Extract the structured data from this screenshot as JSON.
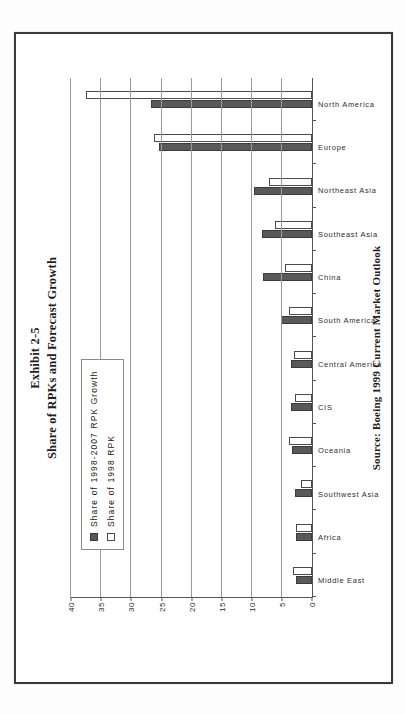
{
  "page": {
    "folio": "",
    "title_line1": "Exhibit 2-5",
    "title_line2": "Share of RPKs and Forecast Growth",
    "source": "Source: Boeing 1999 Current Market Outlook"
  },
  "legend": {
    "items": [
      {
        "label": "Share of 1998-2007 RPK Growth",
        "swatch": "filled-dark-square",
        "color": "#595959"
      },
      {
        "label": "Share of 1998 RPK",
        "swatch": "open-white-square",
        "color": "#ffffff"
      }
    ]
  },
  "chart_data": {
    "type": "bar",
    "title": "Share of RPKs and Forecast Growth",
    "xlabel": "",
    "ylabel": "",
    "ylim": [
      0,
      40
    ],
    "yticks": [
      0,
      5,
      10,
      15,
      20,
      25,
      30,
      35,
      40
    ],
    "grid": true,
    "legend_position": "inside-top-left",
    "orientation": "vertical-bars-on-rotated-page",
    "categories": [
      "Middle East",
      "Africa",
      "Southwest Asia",
      "Oceania",
      "CIS",
      "Central America",
      "South America",
      "China",
      "Southeast Asia",
      "Northeast Asia",
      "Europe",
      "North America"
    ],
    "series": [
      {
        "name": "Share of 1998-2007 RPK Growth",
        "color": "#595959",
        "values": [
          2.6,
          2.6,
          2.8,
          3.4,
          3.5,
          3.5,
          5.2,
          8.2,
          8.3,
          9.6,
          25.5,
          26.8
        ]
      },
      {
        "name": "Share of 1998 RPK",
        "color": "#ffffff",
        "values": [
          3.2,
          2.6,
          1.8,
          3.8,
          2.9,
          3.0,
          3.9,
          4.5,
          6.2,
          7.2,
          26.3,
          37.5
        ]
      }
    ]
  }
}
